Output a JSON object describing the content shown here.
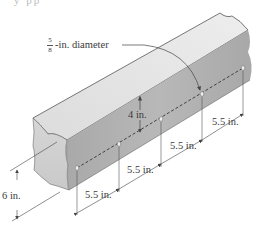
{
  "figure": {
    "cut_off_header_text": "y pp",
    "callout_diameter": {
      "numerator": "5",
      "denominator": "8",
      "suffix": "-in. diameter"
    },
    "dimensions": {
      "beam_height": "6 in.",
      "hole_height": "4 in.",
      "spacing": [
        "5.5 in.",
        "5.5 in.",
        "5.5 in.",
        "5.5 in."
      ]
    },
    "hole_count": 5,
    "colors": {
      "top_face": "#e6e6e6",
      "side_face": "#b3b3b3",
      "end_face": "#d9d9d9",
      "edge_line": "#444444",
      "dim_line": "#555555"
    }
  }
}
